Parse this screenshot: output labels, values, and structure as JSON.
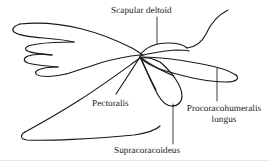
{
  "figure": {
    "type": "anatomical-line-diagram",
    "background_color": "#ffffff",
    "line_color": "#1a1a1a",
    "text_color": "#1a1a1a",
    "width": 270,
    "height": 161
  },
  "labels": {
    "scapular_deltoid": "Scapular deltoid",
    "pectoralis": "Pectoralis",
    "procoracohumeralis_line1": "Procoracohumeralis",
    "procoracohumeralis_line2": "longus",
    "supracoracoideus": "Supracoracoideus"
  },
  "leaders": [
    {
      "name": "leader-scapular-deltoid",
      "x1": 157,
      "y1": 17,
      "x2": 157,
      "y2": 44
    },
    {
      "name": "leader-procoracohumeralis-longus",
      "x1": 217,
      "y1": 68,
      "x2": 217,
      "y2": 101
    },
    {
      "name": "leader-supracoracoideus",
      "x1": 173,
      "y1": 104,
      "x2": 173,
      "y2": 144
    }
  ],
  "structures": [
    {
      "name": "wing-outline",
      "label": null
    },
    {
      "name": "scapular-deltoid-shape",
      "label": "Scapular deltoid"
    },
    {
      "name": "pectoralis-shape",
      "label": "Pectoralis"
    },
    {
      "name": "procoracohumeralis-longus-shape",
      "label": "Procoracohumeralis longus"
    },
    {
      "name": "supracoracoideus-shape",
      "label": "Supracoracoideus"
    }
  ]
}
